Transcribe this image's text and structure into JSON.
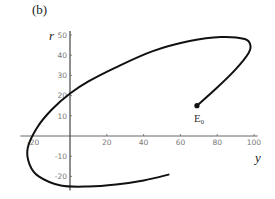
{
  "chart_data": {
    "type": "line",
    "panel_label": "(b)",
    "title": "",
    "xlabel": "y",
    "ylabel": "r",
    "xlim": [
      -27,
      102
    ],
    "ylim": [
      -27,
      52
    ],
    "grid": false,
    "x_ticks": [
      -20,
      20,
      40,
      60,
      80,
      100
    ],
    "y_ticks": [
      50,
      40,
      30,
      20,
      10,
      -10,
      -20
    ],
    "series": [
      {
        "name": "trajectory",
        "points": [
          [
            69,
            15
          ],
          [
            80,
            24
          ],
          [
            90,
            33
          ],
          [
            97,
            41
          ],
          [
            98,
            45
          ],
          [
            95,
            48
          ],
          [
            82,
            49
          ],
          [
            65,
            47
          ],
          [
            45,
            42
          ],
          [
            25,
            34
          ],
          [
            10,
            27
          ],
          [
            0,
            21
          ],
          [
            -10,
            13
          ],
          [
            -18,
            4
          ],
          [
            -23,
            -6
          ],
          [
            -22,
            -14
          ],
          [
            -17,
            -20
          ],
          [
            -5,
            -24.5
          ],
          [
            10,
            -25
          ],
          [
            25,
            -24
          ],
          [
            40,
            -22
          ],
          [
            54,
            -19
          ]
        ]
      }
    ],
    "annotations": [
      {
        "text": "E",
        "subscript": "0",
        "x": 69,
        "y": 15,
        "marker": "dot"
      }
    ]
  }
}
